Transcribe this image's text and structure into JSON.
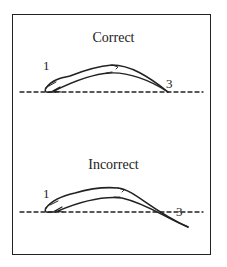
{
  "panels": [
    {
      "title": "Correct",
      "labels": {
        "start": "1",
        "end": "3"
      }
    },
    {
      "title": "Incorrect",
      "labels": {
        "start": "1",
        "end": "3"
      }
    }
  ],
  "colors": {
    "ink": "#222222",
    "background": "#ffffff"
  }
}
